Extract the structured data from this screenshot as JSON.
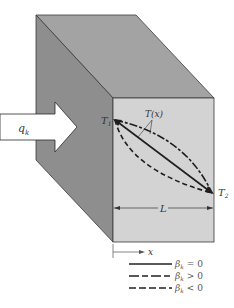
{
  "figure": {
    "colors": {
      "top_face": "#a3a3a3",
      "side_face": "#8e8e8e",
      "front_face": "#d3d3d3",
      "edge": "#3a3a3a",
      "curve": "#1e1e1e"
    },
    "heat_flux": {
      "symbol": "q",
      "subscript": "k"
    },
    "temp_left": {
      "symbol": "T",
      "subscript": "1"
    },
    "temp_right": {
      "symbol": "T",
      "subscript": "2"
    },
    "profile_label": "T(x)",
    "length_label": "L",
    "axis_label": "x",
    "legend": [
      {
        "style": "solid",
        "symbol": "β",
        "subscript": "k",
        "relation": "= 0"
      },
      {
        "style": "dash-dot",
        "symbol": "β",
        "subscript": "k",
        "relation": "> 0"
      },
      {
        "style": "dashed",
        "symbol": "β",
        "subscript": "k",
        "relation": "< 0"
      }
    ]
  }
}
